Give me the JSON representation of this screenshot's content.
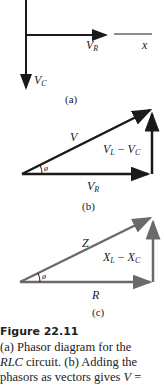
{
  "figure": {
    "number": "Figure 22.11",
    "panels": {
      "a": {
        "label": "(a)",
        "vr": "V",
        "vr_sub": "R",
        "vc": "V",
        "vc_sub": "C",
        "axis": "x"
      },
      "b": {
        "label": "(b)",
        "hyp": "V",
        "vert": "V",
        "vert_sub": "L",
        "minus": " − ",
        "vert2": "V",
        "vert2_sub": "C",
        "base": "V",
        "base_sub": "R",
        "angle": "ø"
      },
      "c": {
        "label": "(c)",
        "hyp": "Z",
        "vert": "X",
        "vert_sub": "L",
        "minus": " − ",
        "vert2": "X",
        "vert2_sub": "C",
        "base": "R",
        "angle": "ø",
        "color": "#6a6a6a"
      }
    },
    "caption": {
      "line1": "(a) Phasor diagram for the",
      "line2_italic": "RLC",
      "line2_rest": " circuit. (b) Adding the",
      "line3": "phasors as vectors gives ",
      "line3_italic": "V",
      "line3_end": " ="
    }
  }
}
